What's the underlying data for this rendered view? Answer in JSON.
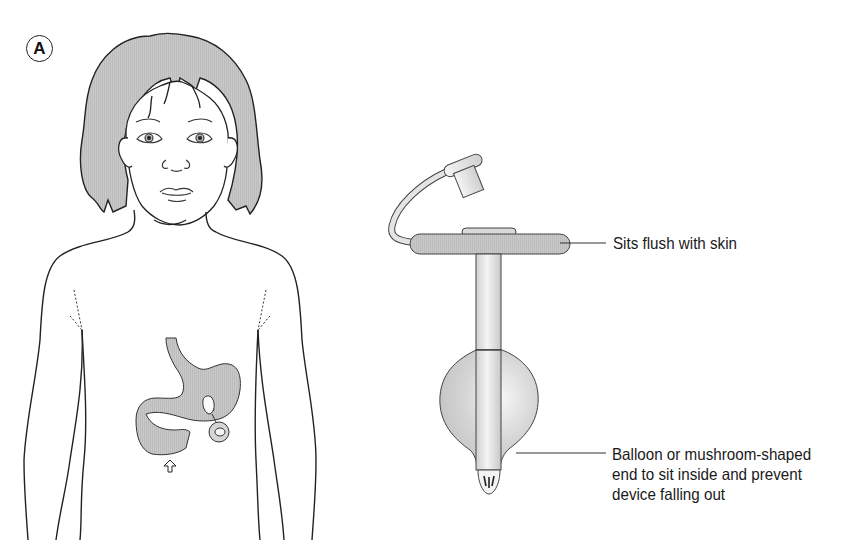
{
  "figure": {
    "panel_label": "A",
    "subjects": {
      "left": "child-torso-with-stomach-and-gastrostomy-device",
      "right": "low-profile-balloon-gastrostomy-device"
    },
    "colors": {
      "line": "#222222",
      "fill_gray": "#c8c8c8",
      "hair_gray": "#bdbdbd",
      "highlight": "#f2f2f2",
      "background": "#ffffff"
    },
    "callouts": {
      "skin": "Sits flush with skin",
      "balloon": {
        "line1": "Balloon or mushroom-shaped",
        "line2": "end to sit inside and prevent",
        "line3": "device falling out"
      }
    },
    "icons": {
      "pylorus_arrow": "up-arrow-icon"
    }
  }
}
